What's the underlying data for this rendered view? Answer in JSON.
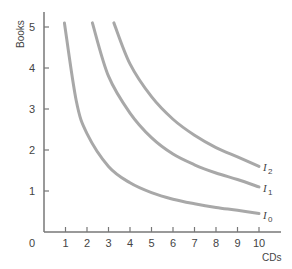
{
  "chart_data": {
    "type": "line",
    "title": "",
    "xlabel": "CDs",
    "ylabel": "Books",
    "origin_label": "0",
    "xlim": [
      0,
      10.8
    ],
    "ylim": [
      0,
      5.4
    ],
    "x_ticks": [
      1,
      2,
      3,
      4,
      5,
      6,
      7,
      8,
      9,
      10
    ],
    "y_ticks": [
      1,
      2,
      3,
      4,
      5
    ],
    "grid": false,
    "colors": {
      "axis": "#777777",
      "curve": "#a8a8a8",
      "text": "#444444"
    },
    "series": [
      {
        "name": "I0",
        "label_base": "I",
        "label_sub": "0",
        "k": 4.8,
        "x": [
          0.95,
          1.5,
          2,
          3,
          4,
          5,
          6,
          7,
          8,
          9,
          10
        ],
        "values": [
          5.1,
          3.2,
          2.4,
          1.6,
          1.2,
          0.96,
          0.8,
          0.69,
          0.6,
          0.53,
          0.45
        ]
      },
      {
        "name": "I1",
        "label_base": "I",
        "label_sub": "1",
        "k": 11.5,
        "x": [
          2.25,
          3,
          4,
          5,
          6,
          7,
          8,
          9,
          10
        ],
        "values": [
          5.1,
          3.8,
          2.9,
          2.3,
          1.9,
          1.64,
          1.44,
          1.28,
          1.1
        ]
      },
      {
        "name": "I2",
        "label_base": "I",
        "label_sub": "2",
        "k": 16.5,
        "x": [
          3.25,
          4,
          5,
          6,
          7,
          8,
          9,
          10
        ],
        "values": [
          5.1,
          4.1,
          3.3,
          2.75,
          2.36,
          2.06,
          1.83,
          1.6
        ]
      }
    ]
  }
}
